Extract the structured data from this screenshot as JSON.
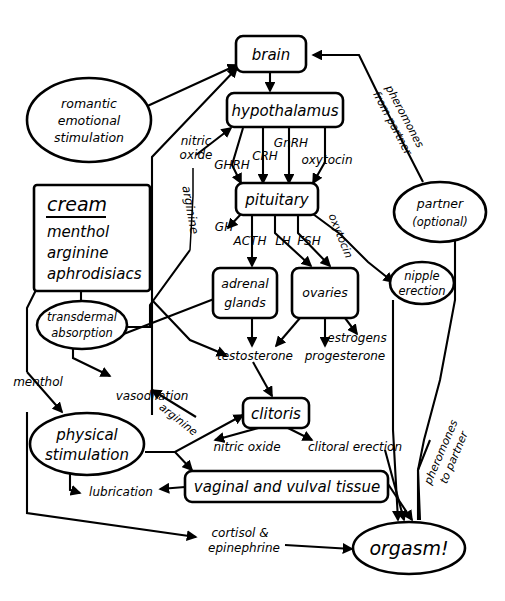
{
  "diagram": {
    "background_color": "#ffffff",
    "line_color": "#000000",
    "nodes": {
      "brain": {
        "label": "brain",
        "shape": "rounded-rect"
      },
      "romantic": {
        "label_line1": "romantic",
        "label_line2": "emotional",
        "label_line3": "stimulation",
        "shape": "ellipse"
      },
      "hypothalamus": {
        "label": "hypothalamus",
        "shape": "rounded-rect"
      },
      "pituitary": {
        "label": "pituitary",
        "shape": "rounded-rect"
      },
      "cream": {
        "title": "cream",
        "items": [
          "menthol",
          "arginine",
          "aphrodisiacs"
        ],
        "shape": "rect"
      },
      "transdermal": {
        "label_line1": "transdermal",
        "label_line2": "absorption",
        "shape": "ellipse"
      },
      "adrenal": {
        "label_line1": "adrenal",
        "label_line2": "glands",
        "shape": "rounded-rect"
      },
      "ovaries": {
        "label": "ovaries",
        "shape": "rounded-rect"
      },
      "partner": {
        "label_line1": "partner",
        "label_line2": "(optional)",
        "shape": "ellipse"
      },
      "nipple": {
        "label_line1": "nipple",
        "label_line2": "erection",
        "shape": "ellipse"
      },
      "physical": {
        "label_line1": "physical",
        "label_line2": "stimulation",
        "shape": "ellipse"
      },
      "clitoris": {
        "label": "clitoris",
        "shape": "rounded-rect"
      },
      "vaginal": {
        "label": "vaginal and vulval tissue",
        "shape": "rounded-rect"
      },
      "orgasm": {
        "label": "orgasm!",
        "shape": "ellipse"
      }
    },
    "edge_labels": {
      "pheromones_from_partner_l1": "pheromones",
      "pheromones_from_partner_l2": "from partner",
      "pheromones_to_partner_l1": "pheromones",
      "pheromones_to_partner_l2": "to partner",
      "nitric_oxide_top_l1": "nitric",
      "nitric_oxide_top_l2": "oxide",
      "arginine_vertical": "arginine",
      "ghrh": "GHRH",
      "crh": "CRH",
      "gnrh": "GnRH",
      "oxytocin_hypo": "oxytocin",
      "gh": "GH",
      "acth": "ACTH",
      "lh": "LH",
      "fsh": "FSH",
      "oxytocin_pit": "oxytocin",
      "testosterone": "testosterone",
      "progesterone": "progesterone",
      "estrogens": "estrogens",
      "menthol": "menthol",
      "vasodilation": "vasodilation",
      "arginine_diag": "arginine",
      "nitric_oxide_clitoris": "nitric oxide",
      "clitoral_erection": "clitoral erection",
      "lubrication": "lubrication",
      "cortisol_l1": "cortisol &",
      "cortisol_l2": "epinephrine"
    }
  }
}
